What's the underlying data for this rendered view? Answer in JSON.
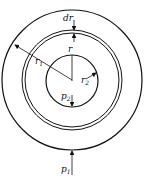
{
  "diagram": {
    "labels": {
      "dr": "dr",
      "r": "r",
      "r1": "r",
      "r1_sub": "1",
      "r2": "r",
      "r2_sub": "2",
      "p2": "p",
      "p2_sub": "2",
      "p1": "p",
      "p1_sub": "1"
    },
    "colors": {
      "stroke": "#111111",
      "background": "#ffffff"
    }
  }
}
